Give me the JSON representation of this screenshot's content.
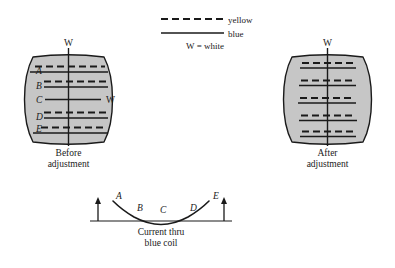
{
  "figure": {
    "legend": {
      "yellow_label": "yellow",
      "blue_label": "blue",
      "white_label": "W = white"
    },
    "left_panel": {
      "top_marker": "W",
      "center_marker": "W",
      "caption_line1": "Before",
      "caption_line2": "adjustment",
      "row_labels": [
        "A",
        "B",
        "C",
        "D",
        "E"
      ],
      "rows": [
        {
          "label": "A",
          "y": 69,
          "x1": 27,
          "x2": 109,
          "converged": false
        },
        {
          "label": "B",
          "y": 83,
          "x1": 27,
          "x2": 110,
          "converged": false
        },
        {
          "label": "C",
          "y": 99,
          "x1": 32,
          "x2": 103,
          "converged": true
        },
        {
          "label": "D",
          "y": 114,
          "x1": 27,
          "x2": 110,
          "converged": false
        },
        {
          "label": "E",
          "y": 129,
          "x1": 26,
          "x2": 109,
          "converged": false
        }
      ]
    },
    "right_panel": {
      "top_marker": "W",
      "caption_line1": "After",
      "caption_line2": "adjustment",
      "rows": [
        {
          "y": 65,
          "x1": 302,
          "x2": 356
        },
        {
          "y": 82,
          "x1": 300,
          "x2": 356
        },
        {
          "y": 100,
          "x1": 299,
          "x2": 357
        },
        {
          "y": 118,
          "x1": 300,
          "x2": 357
        },
        {
          "y": 134,
          "x1": 301,
          "x2": 356
        }
      ]
    },
    "curve_panel": {
      "point_labels": [
        "A",
        "B",
        "C",
        "D",
        "E"
      ],
      "points": [
        {
          "label": "A",
          "lx": 116,
          "ly": 199
        },
        {
          "label": "B",
          "lx": 137,
          "ly": 211
        },
        {
          "label": "C",
          "lx": 160,
          "ly": 213
        },
        {
          "label": "D",
          "lx": 190,
          "ly": 211
        },
        {
          "label": "E",
          "lx": 213,
          "ly": 199
        }
      ],
      "caption_line1": "Current thru",
      "caption_line2": "blue coil"
    },
    "colors": {
      "screen_fill": "#c6c6c6",
      "ink": "#1a1a1a",
      "page_background": "#ffffff"
    }
  }
}
